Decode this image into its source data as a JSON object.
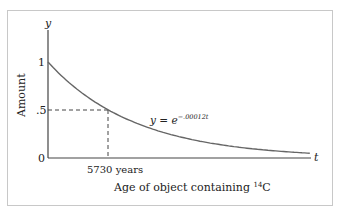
{
  "chart_data": {
    "type": "line",
    "title": "",
    "xlabel": "Age of object containing 14C",
    "xlabel_parts": {
      "prefix": "Age of object containing ",
      "superscript": "14",
      "suffix": "C"
    },
    "ylabel": "Amount",
    "x_axis_var": "t",
    "y_axis_var": "y",
    "y_ticks": [
      "0",
      ".5",
      "1"
    ],
    "x_ticks": [
      "5730 years"
    ],
    "equation": {
      "lhs": "y = e",
      "exponent": "−.00012t"
    },
    "series": [
      {
        "name": "y = e^(-.00012t)",
        "x": [
          0,
          2000,
          4000,
          5730,
          8000,
          10000,
          12000,
          14000,
          16000,
          18000,
          20000,
          22000
        ],
        "values": [
          1.0,
          0.787,
          0.619,
          0.5,
          0.383,
          0.301,
          0.237,
          0.186,
          0.147,
          0.115,
          0.091,
          0.071
        ]
      }
    ],
    "annotations": [
      {
        "type": "dashed-guide",
        "x": 5730,
        "y": 0.5,
        "label": "5730 years"
      }
    ],
    "ylim": [
      0,
      1.25
    ],
    "xlim": [
      0,
      23000
    ],
    "grid": false,
    "legend": "none"
  }
}
